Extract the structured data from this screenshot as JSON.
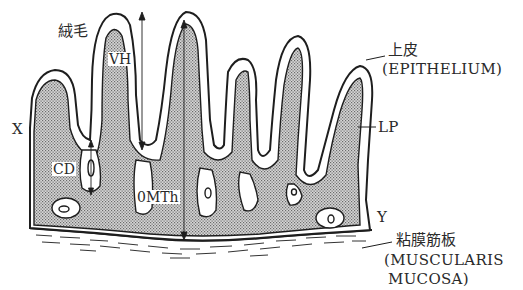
{
  "diagram": {
    "colors": {
      "stroke": "#1e1e1e",
      "stipple_fill": "#bdbdbd",
      "epithelium_fill": "#ffffff",
      "background": "#ffffff"
    },
    "labels": {
      "villus_jp": "絨毛",
      "villus_height": "VH",
      "crypt_depth": "CD",
      "mucosal_thickness": "0MTh",
      "point_x": "X",
      "point_y": "Y",
      "epithelium_jp": "上皮",
      "epithelium_en": "(EPITHELIUM)",
      "lamina_propria": "LP",
      "muscularis_jp": "粘膜筋板",
      "muscularis_en_line1": "(MUSCULARIS",
      "muscularis_en_line2": "MUCOSA)"
    },
    "measurements": [
      {
        "name": "VH",
        "meaning": "villus height",
        "arrow": "double-headed vertical"
      },
      {
        "name": "CD",
        "meaning": "crypt depth",
        "arrow": "double-headed vertical"
      },
      {
        "name": "MTh",
        "meaning": "mucosal thickness",
        "arrow": "double-headed vertical"
      }
    ]
  }
}
